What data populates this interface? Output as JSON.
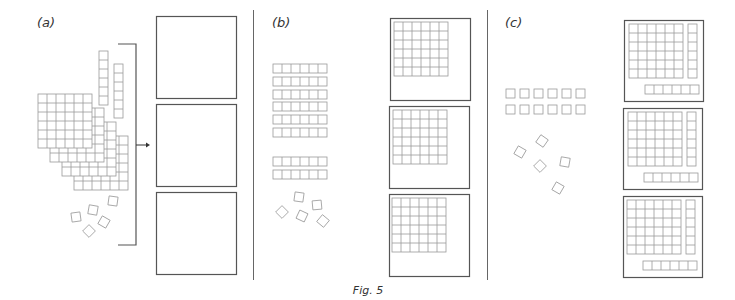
{
  "figure": {
    "caption": "Fig. 5",
    "colors": {
      "frame": "#555555",
      "grid": "#9a9a9a",
      "divider": "#666666",
      "text": "#333333"
    },
    "panels": [
      {
        "id": "a",
        "label": "(a)",
        "description": "Four stacked 6x6 grids, two vertical rods of 6, five loose unit squares, bracket with arrow pointing to three empty boxes",
        "stacked_grids": 4,
        "grid_size": "6x6",
        "rods": 2,
        "rod_length": 6,
        "loose_units": 5,
        "boxes": [
          {
            "contents": "empty"
          },
          {
            "contents": "empty"
          },
          {
            "contents": "empty"
          }
        ]
      },
      {
        "id": "b",
        "label": "(b)",
        "description": "Eight horizontal rods of 6 (groups of 6 and 2), five loose units, three boxes each containing one 6x6 grid",
        "rods": 8,
        "rod_groups": [
          6,
          2
        ],
        "rod_length": 6,
        "loose_units": 5,
        "boxes": [
          {
            "contents": "6x6 grid"
          },
          {
            "contents": "6x6 grid"
          },
          {
            "contents": "6x6 grid"
          }
        ]
      },
      {
        "id": "c",
        "label": "(c)",
        "description": "Twelve unit squares in two rows of six, five loose units, three boxes each containing a 6x6 grid, a vertical rod of 6 and a horizontal rod of 6",
        "unit_rows": 2,
        "units_per_row": 6,
        "loose_units": 5,
        "boxes": [
          {
            "contents": "6x6 grid + vertical rod 6 + horizontal rod 6"
          },
          {
            "contents": "6x6 grid + vertical rod 6 + horizontal rod 6"
          },
          {
            "contents": "6x6 grid + vertical rod 6 + horizontal rod 6"
          }
        ]
      }
    ]
  }
}
